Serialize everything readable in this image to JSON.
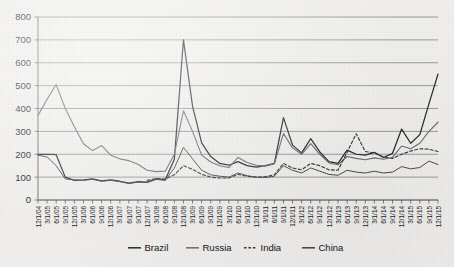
{
  "chart_data": {
    "type": "line",
    "title": "",
    "xlabel": "",
    "ylabel": "",
    "ylim": [
      0,
      800
    ],
    "ytick_step": 100,
    "grid": true,
    "legend_position": "bottom-center",
    "yticks": [
      "0",
      "100",
      "200",
      "300",
      "400",
      "500",
      "600",
      "700",
      "800"
    ],
    "categories": [
      "12/1/04",
      "3/1/05",
      "6/1/05",
      "9/1/05",
      "12/1/05",
      "3/1/06",
      "6/1/06",
      "9/1/06",
      "12/1/06",
      "3/1/07",
      "6/1/07",
      "9/1/07",
      "12/1/07",
      "3/1/08",
      "6/1/08",
      "9/1/08",
      "12/1/08",
      "3/1/09",
      "6/1/09",
      "9/1/09",
      "12/1/09",
      "3/1/10",
      "6/1/10",
      "9/1/10",
      "12/1/10",
      "3/1/11",
      "6/1/11",
      "9/1/11",
      "12/1/11",
      "3/1/12",
      "6/1/12",
      "9/1/12",
      "12/1/12",
      "3/1/13",
      "6/1/13",
      "9/1/13",
      "12/1/13",
      "3/1/14",
      "6/1/14",
      "9/1/14",
      "12/1/14",
      "3/1/15",
      "6/1/15",
      "9/1/15",
      "12/1/15"
    ],
    "series": [
      {
        "name": "Brazil",
        "color": "#2a2a2a",
        "style": "solid",
        "width": 1.25,
        "values": [
          200,
          200,
          198,
          100,
          86,
          88,
          92,
          84,
          88,
          82,
          74,
          80,
          78,
          92,
          88,
          178,
          700,
          410,
          250,
          190,
          160,
          152,
          168,
          150,
          144,
          150,
          160,
          360,
          240,
          206,
          268,
          210,
          168,
          160,
          218,
          200,
          196,
          208,
          186,
          204,
          310,
          248,
          286,
          420,
          550
        ]
      },
      {
        "name": "Russia",
        "color": "#6e6e6e",
        "style": "solid",
        "width": 1.15,
        "values": [
          370,
          440,
          505,
          400,
          320,
          246,
          216,
          238,
          196,
          180,
          172,
          156,
          130,
          124,
          126,
          200,
          390,
          300,
          196,
          166,
          150,
          142,
          186,
          164,
          152,
          148,
          158,
          290,
          228,
          200,
          246,
          200,
          162,
          154,
          190,
          182,
          176,
          184,
          178,
          186,
          236,
          224,
          248,
          300,
          340
        ]
      },
      {
        "name": "India",
        "color": "#3a3a3a",
        "style": "dashed",
        "width": 1.15,
        "values": [
          null,
          null,
          null,
          null,
          null,
          null,
          null,
          null,
          null,
          null,
          null,
          null,
          86,
          94,
          92,
          110,
          150,
          134,
          112,
          100,
          96,
          96,
          112,
          104,
          100,
          102,
          110,
          160,
          140,
          132,
          160,
          150,
          132,
          130,
          208,
          290,
          212,
          206,
          188,
          182,
          200,
          214,
          224,
          222,
          212
        ]
      },
      {
        "name": "China",
        "color": "#404040",
        "style": "solid",
        "width": 0.95,
        "values": [
          196,
          188,
          150,
          92,
          88,
          86,
          90,
          82,
          86,
          80,
          72,
          78,
          76,
          90,
          86,
          140,
          230,
          180,
          130,
          110,
          104,
          100,
          118,
          106,
          100,
          98,
          104,
          150,
          130,
          118,
          140,
          126,
          112,
          108,
          130,
          122,
          118,
          126,
          118,
          122,
          146,
          136,
          142,
          170,
          155
        ]
      }
    ],
    "legend": [
      {
        "label": "Brazil",
        "color": "#2a2a2a",
        "style": "solid"
      },
      {
        "label": "Russia",
        "color": "#6e6e6e",
        "style": "solid"
      },
      {
        "label": "India",
        "color": "#3a3a3a",
        "style": "dashed"
      },
      {
        "label": "China",
        "color": "#404040",
        "style": "solid"
      }
    ]
  }
}
